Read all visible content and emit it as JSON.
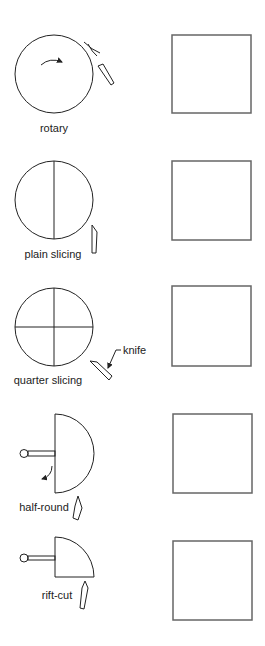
{
  "diagram": {
    "colors": {
      "line": "#222222",
      "square_border": "#666666",
      "background": "#ffffff"
    },
    "methods": [
      {
        "id": "rotary",
        "label": "rotary",
        "log_shape": "full-circle-rotating",
        "has_rotation_arrow": true
      },
      {
        "id": "plain-slicing",
        "label": "plain slicing",
        "log_shape": "circle-halved",
        "has_rotation_arrow": false
      },
      {
        "id": "quarter-slicing",
        "label": "quarter slicing",
        "log_shape": "circle-quartered",
        "has_rotation_arrow": false,
        "callout": "knife"
      },
      {
        "id": "half-round",
        "label": "half-round",
        "log_shape": "half-circle-on-stay-log",
        "has_rotation_arrow": true
      },
      {
        "id": "rift-cut",
        "label": "rift-cut",
        "log_shape": "quarter-circle-on-stay-log",
        "has_rotation_arrow": false
      }
    ],
    "veneer_squares": [
      {
        "id": "rotary-veneer",
        "pattern": "empty"
      },
      {
        "id": "plain-slicing-veneer",
        "pattern": "empty"
      },
      {
        "id": "quarter-slicing-veneer",
        "pattern": "empty"
      },
      {
        "id": "half-round-veneer",
        "pattern": "empty"
      },
      {
        "id": "rift-cut-veneer",
        "pattern": "empty"
      }
    ]
  }
}
